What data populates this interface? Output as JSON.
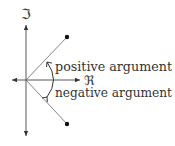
{
  "diagram": {
    "axes": {
      "imaginary_label": "ℑ",
      "real_label": "ℜ"
    },
    "labels": {
      "positive": "positive argument",
      "negative": "negative argument"
    },
    "points": [
      {
        "name": "upper-point",
        "quadrant": "upper-right"
      },
      {
        "name": "lower-point",
        "quadrant": "lower-right"
      }
    ],
    "colors": {
      "line": "#555555",
      "axis": "#333333",
      "point": "#111111",
      "text": "#333333"
    }
  }
}
